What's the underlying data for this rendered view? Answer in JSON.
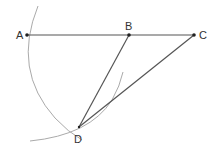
{
  "diagram": {
    "type": "geometric-construction",
    "points": [
      {
        "label": "A",
        "x": 27,
        "y": 35
      },
      {
        "label": "B",
        "x": 129,
        "y": 35
      },
      {
        "label": "C",
        "x": 194,
        "y": 35
      },
      {
        "label": "D",
        "x": 79,
        "y": 127
      }
    ],
    "segments": [
      {
        "from": "A",
        "to": "C"
      },
      {
        "from": "B",
        "to": "D"
      },
      {
        "from": "C",
        "to": "D"
      }
    ],
    "arcs": [
      {
        "description": "arc centered at B through A and D"
      },
      {
        "description": "arc through D extending up toward segment BD"
      }
    ],
    "colors": {
      "line": "#555555",
      "arc": "#aaaaaa",
      "point": "#222222",
      "label": "#333333"
    }
  }
}
